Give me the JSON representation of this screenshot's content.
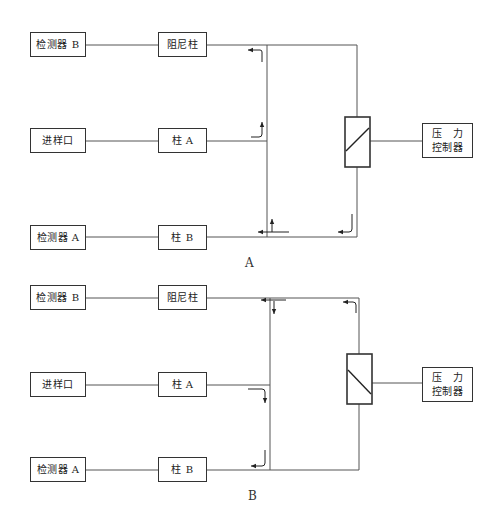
{
  "diagram_a": {
    "label": "A",
    "detector_b": "检测器 B",
    "damping_column": "阻尼柱",
    "sample_inlet": "进样口",
    "column_a": "柱 A",
    "detector_a": "检测器 A",
    "column_b": "柱 B",
    "pressure_controller_line1": "压　力",
    "pressure_controller_line2": "控制器",
    "valve_diagonal": "bottom-left to top-right",
    "flow": "Column A flow directed up toward damping column / detector B; pressure controller flow enters at junction of column B"
  },
  "diagram_b": {
    "label": "B",
    "detector_b": "检测器 B",
    "damping_column": "阻尼柱",
    "sample_inlet": "进样口",
    "column_a": "柱 A",
    "detector_a": "检测器 A",
    "column_b": "柱 B",
    "pressure_controller_line1": "压　力",
    "pressure_controller_line2": "控制器",
    "valve_diagonal": "top-left to bottom-right",
    "flow": "Column A flow directed down toward column B / detector A; pressure controller flow enters at top junction of damping column"
  },
  "colors": {
    "line": "#555555",
    "box_border": "#333333",
    "background": "#ffffff"
  }
}
